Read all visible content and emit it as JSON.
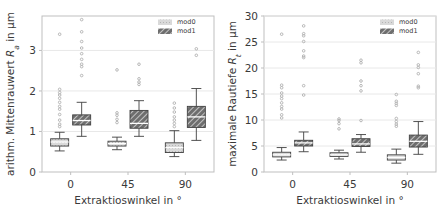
{
  "figure": {
    "background": "#ffffff",
    "panel_count": 2
  },
  "colors": {
    "mod0_fill": "#d9d9d9",
    "mod1_fill": "#6e6e6e",
    "line": "#404040",
    "grid": "#e8e8e8",
    "frame": "#bfbfbf",
    "text": "#3a3a3a",
    "outlier": "#b0b0b0"
  },
  "legend": {
    "items": [
      {
        "label": "mod0",
        "swatch": "mod0"
      },
      {
        "label": "mod1",
        "swatch": "mod1"
      }
    ]
  },
  "chart_data": [
    {
      "id": "left",
      "type": "box",
      "title": "",
      "xlabel": "Extraktioswinkel in  °",
      "ylabel": "arithm. Mittenrauwert Rₐ in µm",
      "ylabel_parts": {
        "pre": "arithm. Mittenrauwert ",
        "italic": "R",
        "sub": "a",
        "post": " in µm"
      },
      "categories": [
        "0",
        "45",
        "90"
      ],
      "xticks": [
        "0",
        "45",
        "90"
      ],
      "yticks": [
        0,
        1,
        2,
        3
      ],
      "ylim": [
        0,
        3.85
      ],
      "grid": true,
      "legend_position": "top-right",
      "series": [
        {
          "name": "mod0",
          "boxes": [
            {
              "category": "0",
              "whisker_low": 0.52,
              "q1": 0.64,
              "median": 0.74,
              "q3": 0.82,
              "whisker_high": 0.98,
              "outliers": [
                1.12,
                1.18,
                1.28,
                1.42,
                1.55,
                1.62,
                1.72,
                1.82,
                1.9,
                1.96,
                2.04,
                3.4
              ]
            },
            {
              "category": "45",
              "whisker_low": 0.55,
              "q1": 0.64,
              "median": 0.7,
              "q3": 0.76,
              "whisker_high": 0.86,
              "outliers": [
                1.22,
                1.3,
                1.4,
                1.46,
                2.52
              ]
            },
            {
              "category": "90",
              "whisker_low": 0.38,
              "q1": 0.48,
              "median": 0.6,
              "q3": 0.72,
              "whisker_high": 1.02,
              "outliers": [
                1.12,
                1.2,
                1.28,
                1.36,
                1.48,
                1.58,
                1.7
              ]
            }
          ]
        },
        {
          "name": "mod1",
          "boxes": [
            {
              "category": "0",
              "whisker_low": 0.88,
              "q1": 1.16,
              "median": 1.27,
              "q3": 1.41,
              "whisker_high": 1.72,
              "outliers": [
                2.38,
                2.6,
                2.66,
                2.78,
                2.92,
                3.06,
                3.22,
                3.46,
                3.76
              ]
            },
            {
              "category": "45",
              "whisker_low": 0.88,
              "q1": 1.08,
              "median": 1.2,
              "q3": 1.52,
              "whisker_high": 1.76,
              "outliers": [
                2.16,
                2.22,
                2.3,
                2.66
              ]
            },
            {
              "category": "90",
              "whisker_low": 0.78,
              "q1": 1.1,
              "median": 1.36,
              "q3": 1.62,
              "whisker_high": 2.06,
              "outliers": [
                2.88,
                3.04
              ]
            }
          ]
        }
      ]
    },
    {
      "id": "right",
      "type": "box",
      "title": "",
      "xlabel": "Extraktioswinkel in  °",
      "ylabel": "maximale Rautiefe Rₜ in µm",
      "ylabel_parts": {
        "pre": "maximale Rautiefe ",
        "italic": "R",
        "sub": "t",
        "post": " in µm"
      },
      "categories": [
        "0",
        "45",
        "90"
      ],
      "xticks": [
        "0",
        "45",
        "90"
      ],
      "yticks": [
        0,
        5,
        10,
        15,
        20,
        25,
        30
      ],
      "ylim": [
        0,
        30
      ],
      "grid": true,
      "legend_position": "top-right",
      "series": [
        {
          "name": "mod0",
          "boxes": [
            {
              "category": "0",
              "whisker_low": 2.3,
              "q1": 2.9,
              "median": 3.3,
              "q3": 3.8,
              "whisker_high": 4.7,
              "outliers": [
                10.4,
                11.0,
                12.1,
                12.6,
                13.3,
                14.1,
                14.6,
                15.2,
                16.2,
                16.7,
                26.5
              ]
            },
            {
              "category": "45",
              "whisker_low": 2.5,
              "q1": 3.0,
              "median": 3.3,
              "q3": 3.7,
              "whisker_high": 4.2,
              "outliers": [
                8.3,
                9.3,
                9.9,
                10.2
              ]
            },
            {
              "category": "90",
              "whisker_low": 1.7,
              "q1": 2.3,
              "median": 2.8,
              "q3": 3.3,
              "whisker_high": 4.4,
              "outliers": [
                8.8,
                9.2,
                9.7,
                10.3,
                12.8,
                13.2,
                13.6,
                14.9
              ]
            }
          ]
        },
        {
          "name": "mod1",
          "boxes": [
            {
              "category": "0",
              "whisker_low": 3.9,
              "q1": 5.0,
              "median": 5.6,
              "q3": 6.1,
              "whisker_high": 7.7,
              "outliers": [
                14.8,
                16.6,
                22.0,
                22.3,
                23.3,
                25.1,
                26.2,
                26.6,
                28.1
              ]
            },
            {
              "category": "45",
              "whisker_low": 3.8,
              "q1": 4.9,
              "median": 5.4,
              "q3": 6.4,
              "whisker_high": 7.2,
              "outliers": [
                9.9,
                15.6,
                16.6,
                17.5,
                21.0,
                21.5
              ]
            },
            {
              "category": "90",
              "whisker_low": 3.4,
              "q1": 4.8,
              "median": 5.9,
              "q3": 7.1,
              "whisker_high": 9.7,
              "outliers": [
                16.2,
                16.5,
                18.9,
                20.1,
                20.6,
                23.0
              ]
            }
          ]
        }
      ]
    }
  ]
}
